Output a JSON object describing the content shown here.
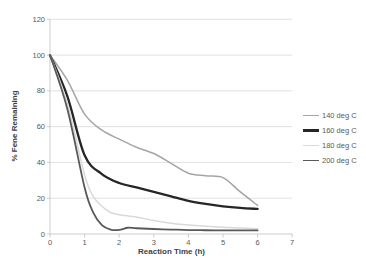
{
  "chart_data": {
    "type": "line",
    "title": "",
    "xlabel": "Reaction Time (h)",
    "ylabel": "% Fene Remaining",
    "xlim": [
      0,
      7
    ],
    "ylim": [
      0,
      120
    ],
    "x_ticks": [
      0,
      1,
      2,
      3,
      4,
      5,
      6,
      7
    ],
    "y_ticks": [
      0,
      20,
      40,
      60,
      80,
      100,
      120
    ],
    "grid": "horizontal",
    "legend_position": "right-middle",
    "series": [
      {
        "name": "140 deg C",
        "color": "#a5a5a5",
        "line_width": 1.5,
        "x": [
          0,
          0.5,
          1,
          1.5,
          2,
          2.5,
          3,
          3.5,
          4,
          4.5,
          5,
          5.5,
          6
        ],
        "y": [
          100,
          86,
          67,
          58,
          53,
          48.5,
          45,
          39.5,
          34,
          32.5,
          31.5,
          23.5,
          16
        ]
      },
      {
        "name": "160 deg C",
        "color": "#262626",
        "line_width": 2.3,
        "x": [
          0,
          0.5,
          1,
          1.5,
          2,
          2.5,
          3,
          3.5,
          4,
          4.5,
          5,
          5.5,
          6
        ],
        "y": [
          100,
          77,
          44,
          33.5,
          28.5,
          26,
          23.5,
          21,
          18.5,
          16.8,
          15.5,
          14.6,
          14
        ]
      },
      {
        "name": "180 deg C",
        "color": "#d9d9d9",
        "line_width": 1.5,
        "x": [
          0,
          0.5,
          1,
          1.25,
          1.5,
          1.75,
          2,
          2.5,
          3,
          3.5,
          4,
          4.5,
          5,
          5.5,
          6
        ],
        "y": [
          100,
          73,
          33,
          21,
          15.5,
          12,
          10.8,
          9.5,
          7.5,
          6,
          5,
          4.3,
          3.8,
          3.3,
          3
        ]
      },
      {
        "name": "200 deg C",
        "color": "#595959",
        "line_width": 1.8,
        "x": [
          0,
          0.5,
          1,
          1.25,
          1.5,
          1.75,
          2,
          2.25,
          2.5,
          3,
          3.5,
          4,
          4.5,
          5,
          5.5,
          6
        ],
        "y": [
          100,
          70,
          26,
          12,
          5,
          2.5,
          2.3,
          3.5,
          3.2,
          2.8,
          2.5,
          2.2,
          2.1,
          2,
          2,
          2
        ]
      }
    ]
  },
  "styles": {
    "background": "#ffffff",
    "grid_color": "#d9d9d9",
    "axis_color": "#bfbfbf",
    "tick_label_color": "#595959",
    "title_color": "#3f3f3f"
  }
}
